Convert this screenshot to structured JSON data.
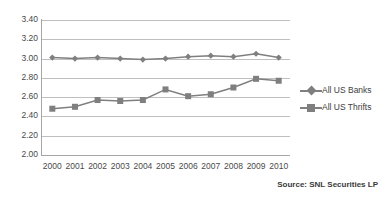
{
  "chart_data": {
    "type": "line",
    "title": "",
    "xlabel": "",
    "ylabel": "",
    "categories": [
      "2000",
      "2001",
      "2002",
      "2003",
      "2004",
      "2005",
      "2006",
      "2007",
      "2008",
      "2009",
      "2010"
    ],
    "series": [
      {
        "name": "All US Banks",
        "marker": "diamond",
        "color": "#7f7f7f",
        "values": [
          3.01,
          3.0,
          3.01,
          3.0,
          2.99,
          3.0,
          3.02,
          3.03,
          3.02,
          3.05,
          3.01
        ]
      },
      {
        "name": "All US Thrifts",
        "marker": "square",
        "color": "#7f7f7f",
        "values": [
          2.48,
          2.5,
          2.57,
          2.56,
          2.57,
          2.68,
          2.61,
          2.63,
          2.7,
          2.79,
          2.77
        ]
      }
    ],
    "ylim": [
      2.0,
      3.4
    ],
    "ytick_labels": [
      "3.40",
      "3.20",
      "3.00",
      "2.80",
      "2.60",
      "2.40",
      "2.20",
      "2.00"
    ],
    "ytick_values": [
      3.4,
      3.2,
      3.0,
      2.8,
      2.6,
      2.4,
      2.2,
      2.0
    ],
    "grid": true,
    "legend_position": "right",
    "annotations": [
      "Source: SNL Securities LP"
    ]
  },
  "legend": {
    "items": [
      {
        "label": "All US Banks",
        "marker": "diamond-icon"
      },
      {
        "label": "All US Thrifts",
        "marker": "square-icon"
      }
    ]
  },
  "footer": {
    "source": "Source: SNL Securities LP"
  },
  "colors": {
    "series": "#7f7f7f",
    "gridline": "#bfbfbf",
    "axis": "#a6a6a6",
    "text": "#4a4a4a",
    "background": "#ffffff"
  }
}
